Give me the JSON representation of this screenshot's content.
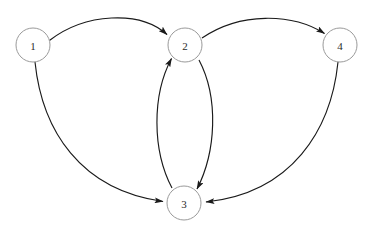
{
  "diagram": {
    "background_color": "#ffffff",
    "node_fill_color": "#ffffff",
    "node_stroke_color": "#9a9a9a",
    "edge_color": "#1a1a1a",
    "label_color": "#2b2b2b",
    "node_radius": 17,
    "nodes": [
      {
        "id": "1",
        "label": "1",
        "cx": 33,
        "cy": 45
      },
      {
        "id": "2",
        "label": "2",
        "cx": 185,
        "cy": 45
      },
      {
        "id": "3",
        "label": "3",
        "cx": 184,
        "cy": 203
      },
      {
        "id": "4",
        "label": "4",
        "cx": 340,
        "cy": 45
      }
    ],
    "edges": [
      {
        "id": "e1",
        "from": "1",
        "to": "2",
        "directed": true,
        "shape": "arc-up",
        "path": "M 49.4 40.5 C 85 13 140 10 167 34.5"
      },
      {
        "id": "e2",
        "from": "2",
        "to": "4",
        "directed": true,
        "shape": "arc-up",
        "path": "M 202 38 C 240 12 292 13 324.5 33.5"
      },
      {
        "id": "e3",
        "from": "1",
        "to": "3",
        "directed": true,
        "shape": "wide-curve-left",
        "path": "M 35 62 C 42 130 80 190 163 201.5"
      },
      {
        "id": "e4",
        "from": "4",
        "to": "3",
        "directed": true,
        "shape": "wide-curve-right",
        "path": "M 338 62 C 331 130 292 193 206 202"
      },
      {
        "id": "e5",
        "from": "3",
        "to": "2",
        "directed": true,
        "shape": "inner-curve-left",
        "path": "M 172 188 C 152 150 152 95 171.5 58.5"
      },
      {
        "id": "e6",
        "from": "2",
        "to": "3",
        "directed": true,
        "shape": "inner-curve-right",
        "path": "M 199 60 C 219 98 216 152 197 189"
      }
    ],
    "arrowhead": {
      "name": "arrow-marker",
      "width": 9,
      "height": 6
    }
  }
}
